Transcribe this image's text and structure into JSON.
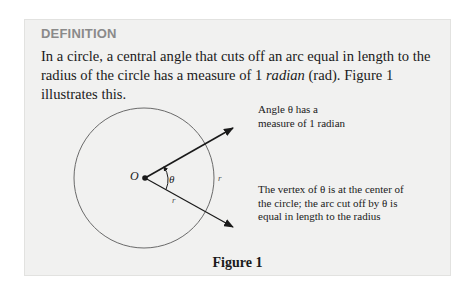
{
  "definition": {
    "header": "DEFINITION",
    "text_before": "In a circle, a central angle that cuts off an arc equal in length to the radius of the circle has a measure of 1 ",
    "text_italic": "radian",
    "text_after": " (rad). Figure 1 illustrates this."
  },
  "figure": {
    "caption": "Figure 1",
    "labels": {
      "center": "O",
      "angle": "θ",
      "radius": "r",
      "arc": "r"
    },
    "annotation_top": {
      "line1": "Angle θ has a",
      "line2": "measure of 1 radian"
    },
    "annotation_bottom": {
      "line1": "The vertex of θ is at the center of",
      "line2": "the circle; the arc cut off by θ is",
      "line3": "equal in length to the radius"
    }
  },
  "colors": {
    "box_background": "#f1f1f0",
    "header": "#8a8a8a",
    "text": "#1a1a1a"
  }
}
